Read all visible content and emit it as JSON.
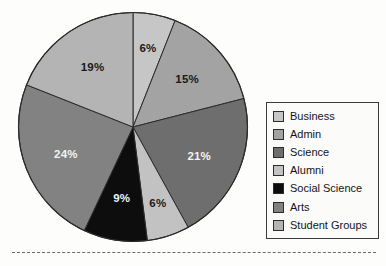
{
  "chart_data": {
    "type": "pie",
    "title": "",
    "subtitle": "",
    "xlabel": "",
    "ylabel": "",
    "grid": false,
    "legend_position": "right",
    "units": "percent",
    "start_angle_deg": 0,
    "direction": "clockwise",
    "categories": [
      "Business",
      "Admin",
      "Science",
      "Alumni",
      "Social Science",
      "Arts",
      "Student Groups"
    ],
    "values": [
      6,
      15,
      21,
      6,
      9,
      24,
      19
    ],
    "value_labels": [
      "6%",
      "15%",
      "21%",
      "6%",
      "9%",
      "24%",
      "19%"
    ],
    "colors": [
      "#c6c6c6",
      "#a3a3a3",
      "#6e6e6e",
      "#c2c2c2",
      "#0d0d0d",
      "#828282",
      "#b4b4b4"
    ],
    "label_text_colors": [
      "dark",
      "dark",
      "light",
      "dark",
      "light",
      "light",
      "dark"
    ],
    "slices": [
      {
        "label": "Business",
        "value": 6,
        "value_label": "6%",
        "color": "#c6c6c6",
        "label_color": "dark"
      },
      {
        "label": "Admin",
        "value": 15,
        "value_label": "15%",
        "color": "#a3a3a3",
        "label_color": "dark"
      },
      {
        "label": "Science",
        "value": 21,
        "value_label": "21%",
        "color": "#6e6e6e",
        "label_color": "light"
      },
      {
        "label": "Alumni",
        "value": 6,
        "value_label": "6%",
        "color": "#c2c2c2",
        "label_color": "dark"
      },
      {
        "label": "Social Science",
        "value": 9,
        "value_label": "9%",
        "color": "#0d0d0d",
        "label_color": "light"
      },
      {
        "label": "Arts",
        "value": 24,
        "value_label": "24%",
        "color": "#828282",
        "label_color": "light"
      },
      {
        "label": "Student Groups",
        "value": 19,
        "value_label": "19%",
        "color": "#b4b4b4",
        "label_color": "dark"
      }
    ]
  },
  "legend": {
    "items": [
      {
        "label": "Business",
        "color": "#c6c6c6"
      },
      {
        "label": "Admin",
        "color": "#a3a3a3"
      },
      {
        "label": "Science",
        "color": "#6e6e6e"
      },
      {
        "label": "Alumni",
        "color": "#c2c2c2"
      },
      {
        "label": "Social Science",
        "color": "#0d0d0d"
      },
      {
        "label": "Arts",
        "color": "#828282"
      },
      {
        "label": "Student Groups",
        "color": "#b4b4b4"
      }
    ]
  },
  "style": {
    "slice_outline": "#2b2b2b",
    "legend_border": "#3a3a3a",
    "background": "#fdfdfc",
    "rule_color": "#6b6b6b"
  }
}
